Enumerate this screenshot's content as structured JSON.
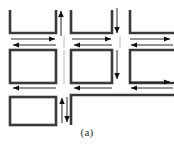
{
  "figure": {
    "caption": "(a)",
    "type": "schematic-diagram",
    "colors": {
      "background": "#ffffff",
      "thick_link": "#3a3a3a",
      "thin_arrow": "#1a1a1a",
      "caption_text": "#2b2b2b"
    },
    "geometry": {
      "width": 174,
      "height": 152,
      "diagram_height": 128,
      "thick_stroke": 2.6,
      "thin_stroke": 0.9
    },
    "blocks": [
      {
        "name": "block-top-left",
        "x": 9,
        "y": 9,
        "w": 45,
        "h": 23,
        "open_side": "top"
      },
      {
        "name": "block-top-mid",
        "x": 70,
        "y": 9,
        "w": 40,
        "h": 23,
        "open_side": "top"
      },
      {
        "name": "block-top-right",
        "x": 127,
        "y": 9,
        "w": 47,
        "h": 23,
        "open_side": "top-left"
      },
      {
        "name": "block-mid-left",
        "x": 9,
        "y": 50,
        "w": 45,
        "h": 32,
        "open_side": "none"
      },
      {
        "name": "block-mid-mid",
        "x": 70,
        "y": 50,
        "w": 40,
        "h": 32,
        "open_side": "none"
      },
      {
        "name": "block-mid-right",
        "x": 127,
        "y": 50,
        "w": 47,
        "h": 32,
        "open_side": "right"
      },
      {
        "name": "block-bot-left",
        "x": 9,
        "y": 97,
        "w": 45,
        "h": 28,
        "open_side": "none"
      },
      {
        "name": "block-bot-right",
        "x": 70,
        "y": 92,
        "w": 104,
        "h": 6,
        "open_side": "right"
      }
    ],
    "arrows": {
      "horizontal": [
        {
          "name": "arrow-row1-right-seg1",
          "x1": 11,
          "x2": 58,
          "y": 39,
          "dir": "right"
        },
        {
          "name": "arrow-row1-left-seg1",
          "x1": 58,
          "x2": 9,
          "y": 45,
          "dir": "left"
        },
        {
          "name": "arrow-row1-right-seg2",
          "x1": 72,
          "x2": 114,
          "y": 39,
          "dir": "right"
        },
        {
          "name": "arrow-row1-left-seg2",
          "x1": 114,
          "x2": 70,
          "y": 45,
          "dir": "left"
        },
        {
          "name": "arrow-row1-right-seg3",
          "x1": 129,
          "x2": 172,
          "y": 39,
          "dir": "right"
        },
        {
          "name": "arrow-row1-left-seg3",
          "x1": 172,
          "x2": 127,
          "y": 45,
          "dir": "left"
        },
        {
          "name": "arrow-row2-left-seg1",
          "x1": 58,
          "x2": 9,
          "y": 88,
          "dir": "left"
        },
        {
          "name": "arrow-row2-left-seg2",
          "x1": 114,
          "x2": 70,
          "y": 88,
          "dir": "left"
        },
        {
          "name": "arrow-row2-right-seg3",
          "x1": 129,
          "x2": 172,
          "y": 82,
          "dir": "right"
        },
        {
          "name": "arrow-row2-left-seg3",
          "x1": 172,
          "x2": 127,
          "y": 88,
          "dir": "left"
        }
      ],
      "vertical": [
        {
          "name": "arrow-col1-up",
          "x": 60,
          "y1": 34,
          "y2": 8,
          "dir": "up"
        },
        {
          "name": "arrow-col2-down",
          "x": 116,
          "y1": 8,
          "y2": 34,
          "dir": "down"
        },
        {
          "name": "arrow-col2-down2",
          "x": 116,
          "y1": 52,
          "y2": 80,
          "dir": "down"
        },
        {
          "name": "arrow-col1-up2",
          "x": 60,
          "y1": 124,
          "y2": 96,
          "dir": "up"
        },
        {
          "name": "arrow-col1-down2",
          "x": 65,
          "y1": 96,
          "y2": 124,
          "dir": "down"
        }
      ]
    }
  }
}
